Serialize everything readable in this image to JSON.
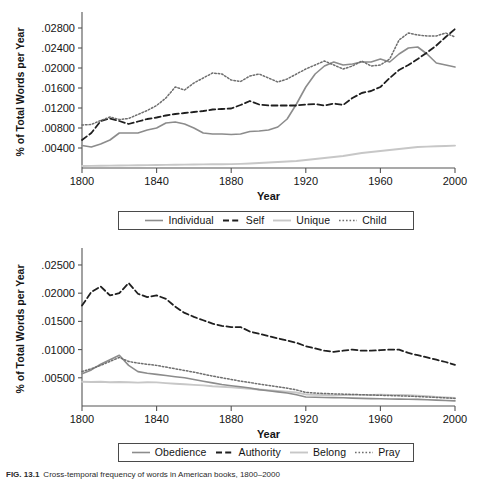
{
  "figure": {
    "caption_label": "FIG. 13.1",
    "caption_text": "Cross-temporal frequency of words in American books, 1800–2000"
  },
  "chart_data": [
    {
      "type": "line",
      "title": "",
      "xlabel": "Year",
      "ylabel": "% of Total Words per Year",
      "xlim": [
        1800,
        2000
      ],
      "ylim": [
        0,
        0.0304
      ],
      "xticks": [
        "1800",
        "1840",
        "1880",
        "1920",
        "1960",
        "2000"
      ],
      "xtick_values": [
        1800,
        1840,
        1880,
        1920,
        1960,
        2000
      ],
      "yticks": [
        ".00400",
        ".00800",
        ".01200",
        ".01600",
        ".02000",
        ".02400",
        ".02800"
      ],
      "ytick_values": [
        0.004,
        0.008,
        0.012,
        0.016,
        0.02,
        0.024,
        0.028
      ],
      "grid": false,
      "legend_position": "below",
      "x": [
        1800,
        1805,
        1810,
        1815,
        1820,
        1825,
        1830,
        1835,
        1840,
        1845,
        1850,
        1855,
        1860,
        1865,
        1870,
        1875,
        1880,
        1885,
        1890,
        1895,
        1900,
        1905,
        1910,
        1915,
        1920,
        1925,
        1930,
        1935,
        1940,
        1945,
        1950,
        1955,
        1960,
        1965,
        1970,
        1975,
        1980,
        1985,
        1990,
        1995,
        2000
      ],
      "series": [
        {
          "name": "Individual",
          "style": "solid",
          "color": "#8c8c8c",
          "values": [
            0.0045,
            0.0042,
            0.0048,
            0.0056,
            0.007,
            0.007,
            0.007,
            0.0076,
            0.008,
            0.009,
            0.0092,
            0.0088,
            0.008,
            0.007,
            0.0068,
            0.0068,
            0.0067,
            0.0068,
            0.0073,
            0.0074,
            0.0076,
            0.0082,
            0.0098,
            0.0128,
            0.0162,
            0.0188,
            0.0204,
            0.0212,
            0.0206,
            0.0208,
            0.0212,
            0.0212,
            0.0218,
            0.0212,
            0.0228,
            0.024,
            0.0242,
            0.0228,
            0.021,
            0.0206,
            0.0202
          ]
        },
        {
          "name": "Self",
          "style": "dashed",
          "color": "#1f1f1f",
          "values": [
            0.0056,
            0.007,
            0.0094,
            0.0099,
            0.0094,
            0.0088,
            0.0093,
            0.0098,
            0.0101,
            0.0105,
            0.0108,
            0.011,
            0.0112,
            0.0114,
            0.0117,
            0.0118,
            0.0119,
            0.0126,
            0.0134,
            0.0127,
            0.0125,
            0.0125,
            0.0125,
            0.0125,
            0.0127,
            0.0128,
            0.0125,
            0.0129,
            0.0126,
            0.014,
            0.015,
            0.0154,
            0.0162,
            0.018,
            0.0196,
            0.0206,
            0.0218,
            0.0231,
            0.0245,
            0.0262,
            0.0278
          ]
        },
        {
          "name": "Unique",
          "style": "solid-light",
          "color": "#c7c7c7",
          "values": [
            0.0004,
            0.00042,
            0.00045,
            0.00048,
            0.0005,
            0.00052,
            0.00055,
            0.00058,
            0.0006,
            0.00062,
            0.00065,
            0.00068,
            0.0007,
            0.00072,
            0.00074,
            0.00076,
            0.00078,
            0.00082,
            0.0009,
            0.001,
            0.0011,
            0.0012,
            0.0013,
            0.0014,
            0.0016,
            0.0018,
            0.002,
            0.0022,
            0.0024,
            0.0027,
            0.003,
            0.0032,
            0.0034,
            0.0036,
            0.0038,
            0.004,
            0.0042,
            0.00428,
            0.00434,
            0.0044,
            0.00448
          ]
        },
        {
          "name": "Child",
          "style": "dotted",
          "color": "#6e6e6e",
          "values": [
            0.0086,
            0.0087,
            0.0095,
            0.0102,
            0.0097,
            0.0099,
            0.0107,
            0.0115,
            0.0125,
            0.014,
            0.0162,
            0.0156,
            0.017,
            0.018,
            0.019,
            0.0188,
            0.0176,
            0.0173,
            0.0184,
            0.0188,
            0.018,
            0.0172,
            0.0178,
            0.0188,
            0.0198,
            0.0206,
            0.0214,
            0.0206,
            0.0198,
            0.0204,
            0.0214,
            0.0204,
            0.0206,
            0.0218,
            0.0256,
            0.027,
            0.0266,
            0.0264,
            0.0264,
            0.027,
            0.0262
          ]
        }
      ]
    },
    {
      "type": "line",
      "title": "",
      "xlabel": "Year",
      "ylabel": "% of Total Words per Year",
      "xlim": [
        1800,
        2000
      ],
      "ylim": [
        0,
        0.0273
      ],
      "xticks": [
        "1800",
        "1840",
        "1880",
        "1920",
        "1960",
        "2000"
      ],
      "xtick_values": [
        1800,
        1840,
        1880,
        1920,
        1960,
        2000
      ],
      "yticks": [
        ".00500",
        ".01000",
        ".01500",
        ".02000",
        ".02500"
      ],
      "ytick_values": [
        0.005,
        0.01,
        0.015,
        0.02,
        0.025
      ],
      "grid": false,
      "legend_position": "below",
      "x": [
        1800,
        1805,
        1810,
        1815,
        1820,
        1825,
        1830,
        1835,
        1840,
        1845,
        1850,
        1855,
        1860,
        1865,
        1870,
        1875,
        1880,
        1885,
        1890,
        1895,
        1900,
        1905,
        1910,
        1915,
        1920,
        1925,
        1930,
        1935,
        1940,
        1945,
        1950,
        1955,
        1960,
        1965,
        1970,
        1975,
        1980,
        1985,
        1990,
        1995,
        2000
      ],
      "series": [
        {
          "name": "Obedience",
          "style": "solid",
          "color": "#8c8c8c",
          "values": [
            0.0057,
            0.0064,
            0.0074,
            0.0082,
            0.009,
            0.0072,
            0.0061,
            0.0058,
            0.0056,
            0.0054,
            0.0052,
            0.005,
            0.0047,
            0.0044,
            0.0041,
            0.0038,
            0.0036,
            0.0034,
            0.0032,
            0.0029,
            0.0027,
            0.0025,
            0.0023,
            0.002,
            0.0016,
            0.00155,
            0.0015,
            0.00148,
            0.00145,
            0.0014,
            0.00135,
            0.0013,
            0.00128,
            0.00125,
            0.00122,
            0.0012,
            0.00118,
            0.00112,
            0.00105,
            0.00098,
            0.0009
          ]
        },
        {
          "name": "Authority",
          "style": "dashed",
          "color": "#1f1f1f",
          "values": [
            0.0178,
            0.0202,
            0.0212,
            0.0196,
            0.02,
            0.0218,
            0.0199,
            0.0193,
            0.0196,
            0.019,
            0.0176,
            0.0165,
            0.0158,
            0.0152,
            0.0146,
            0.0142,
            0.014,
            0.014,
            0.0132,
            0.0128,
            0.0124,
            0.012,
            0.0116,
            0.0112,
            0.0106,
            0.0102,
            0.0098,
            0.0096,
            0.0098,
            0.01,
            0.0098,
            0.0098,
            0.0099,
            0.01,
            0.01,
            0.0094,
            0.009,
            0.0086,
            0.0082,
            0.0078,
            0.0073
          ]
        },
        {
          "name": "Belong",
          "style": "solid-light",
          "color": "#c7c7c7",
          "values": [
            0.0043,
            0.00425,
            0.0043,
            0.0042,
            0.00425,
            0.0042,
            0.00415,
            0.0042,
            0.00418,
            0.00405,
            0.00395,
            0.00385,
            0.00375,
            0.00365,
            0.0035,
            0.0034,
            0.0033,
            0.00318,
            0.00305,
            0.00292,
            0.0028,
            0.00268,
            0.00255,
            0.0024,
            0.00205,
            0.002,
            0.00196,
            0.00192,
            0.00195,
            0.002,
            0.00198,
            0.00195,
            0.002,
            0.00198,
            0.00195,
            0.0019,
            0.00182,
            0.00172,
            0.00162,
            0.00152,
            0.00142
          ]
        },
        {
          "name": "Pray",
          "style": "dotted",
          "color": "#6e6e6e",
          "values": [
            0.0061,
            0.0066,
            0.0072,
            0.0079,
            0.0086,
            0.0079,
            0.0076,
            0.0074,
            0.0072,
            0.0069,
            0.0066,
            0.0063,
            0.006,
            0.00565,
            0.0053,
            0.005,
            0.0047,
            0.0044,
            0.00415,
            0.0039,
            0.00365,
            0.0034,
            0.00315,
            0.00285,
            0.0024,
            0.0023,
            0.00222,
            0.00215,
            0.0021,
            0.00205,
            0.002,
            0.00195,
            0.0019,
            0.00185,
            0.0018,
            0.00175,
            0.00168,
            0.0016,
            0.00152,
            0.00145,
            0.00135
          ]
        }
      ]
    }
  ],
  "panel_1": {
    "ylabel": "% of Total Words per Year",
    "xlabel": "Year",
    "legend": [
      {
        "label": "Individual",
        "style": "solid",
        "color": "#8c8c8c"
      },
      {
        "label": "Self",
        "style": "dashed",
        "color": "#1f1f1f"
      },
      {
        "label": "Unique",
        "style": "solid-light",
        "color": "#c7c7c7"
      },
      {
        "label": "Child",
        "style": "dotted",
        "color": "#6e6e6e"
      }
    ]
  },
  "panel_2": {
    "ylabel": "% of Total Words per Year",
    "xlabel": "Year",
    "legend": [
      {
        "label": "Obedience",
        "style": "solid",
        "color": "#8c8c8c"
      },
      {
        "label": "Authority",
        "style": "dashed",
        "color": "#1f1f1f"
      },
      {
        "label": "Belong",
        "style": "solid-light",
        "color": "#c7c7c7"
      },
      {
        "label": "Pray",
        "style": "dotted",
        "color": "#6e6e6e"
      }
    ]
  }
}
